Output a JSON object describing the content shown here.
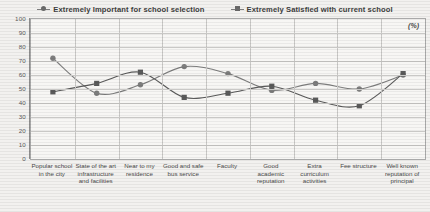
{
  "legend": {
    "items": [
      {
        "label": "Extremely Important for school selection",
        "marker": "diamond-marker-icon",
        "color": "#7d7d7d"
      },
      {
        "label": "Extremely Satisfied with current school",
        "marker": "square-marker-icon",
        "color": "#5a5a5a"
      }
    ]
  },
  "annotation": "(%)",
  "axis": {
    "yticks": [
      "100",
      "90",
      "80",
      "70",
      "60",
      "50",
      "40",
      "30",
      "20",
      "10",
      "0"
    ]
  },
  "chart_data": {
    "type": "line",
    "title": "",
    "subtitle": "",
    "xlabel": "",
    "ylabel": "",
    "ylim": [
      0,
      100
    ],
    "ytick_step": 10,
    "grid": true,
    "legend_position": "top",
    "annotation": "(%)",
    "categories": [
      "Popular school in the city",
      "State of the art infrastructure and facilities",
      "Near to my residence",
      "Good and safe bus service",
      "Faculty",
      "Good academic reputation",
      "Extra curriculum activities",
      "Fee structure",
      "Well known reputation of principal"
    ],
    "series": [
      {
        "name": "Extremely Important for school selection",
        "marker": "diamond",
        "color": "#7d7d7d",
        "values": [
          72,
          47,
          53,
          66,
          61,
          49,
          54,
          50,
          60
        ]
      },
      {
        "name": "Extremely Satisfied with current school",
        "marker": "square",
        "color": "#5a5a5a",
        "values": [
          48,
          54,
          62,
          44,
          47,
          52,
          42,
          38,
          61
        ]
      }
    ]
  }
}
